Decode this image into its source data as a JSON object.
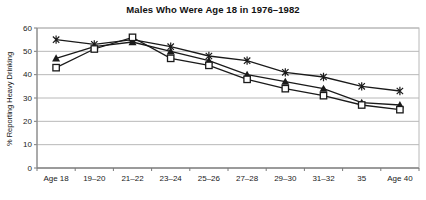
{
  "title": "Males Who Were Age 18 in 1976–1982",
  "chart_data": {
    "type": "line",
    "title": "Males Who Were Age 18 in 1976–1982",
    "xlabel": "",
    "ylabel": "% Reporting Heavy Drinking",
    "ylim": [
      0,
      60
    ],
    "yticks": [
      0,
      10,
      20,
      30,
      40,
      50,
      60
    ],
    "grid": true,
    "legend": "none",
    "categories": [
      "Age 18",
      "19–20",
      "21–22",
      "23–24",
      "25–26",
      "27–28",
      "29–30",
      "31–32",
      "35",
      "Age 40"
    ],
    "series": [
      {
        "name": "asterisk-series",
        "marker": "asterisk",
        "values": [
          55,
          53,
          55,
          52,
          48,
          46,
          41,
          39,
          35,
          33
        ]
      },
      {
        "name": "triangle-series",
        "marker": "triangle-filled",
        "values": [
          47,
          52,
          54,
          50,
          46,
          40,
          37,
          34,
          28,
          27
        ]
      },
      {
        "name": "square-series",
        "marker": "square-open",
        "values": [
          43,
          51,
          56,
          47,
          44,
          38,
          34,
          31,
          27,
          25
        ]
      }
    ],
    "colors": {
      "line": "#1a1a1a",
      "grid": "#b8b8b8",
      "axis": "#7a7a7a",
      "text": "#1a1a1a",
      "background": "#ffffff"
    }
  }
}
